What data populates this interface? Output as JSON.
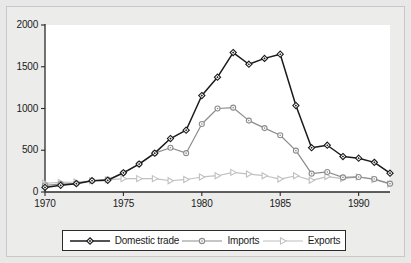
{
  "chart_data": {
    "type": "line",
    "title": "",
    "subtitle": "",
    "xlabel": "",
    "ylabel": "",
    "xlim": [
      1970,
      1992
    ],
    "ylim": [
      0,
      2000
    ],
    "grid": false,
    "legend_position": "bottom",
    "x": [
      1970,
      1971,
      1972,
      1973,
      1974,
      1975,
      1976,
      1977,
      1978,
      1979,
      1980,
      1981,
      1982,
      1983,
      1984,
      1985,
      1986,
      1987,
      1988,
      1989,
      1990,
      1991,
      1992
    ],
    "xticks": [
      1970,
      1975,
      1980,
      1985,
      1990
    ],
    "xticklabels": [
      "1970",
      "1975",
      "1980",
      "1985",
      "1990"
    ],
    "yticks": [
      0,
      500,
      1000,
      1500,
      2000
    ],
    "yticklabels": [
      "0",
      "500",
      "1000",
      "1500",
      "2000"
    ],
    "series": [
      {
        "name": "Domestic trade",
        "marker": "diamond",
        "color": "#1a1a1a",
        "values": [
          55,
          80,
          100,
          135,
          140,
          230,
          335,
          465,
          640,
          740,
          1155,
          1375,
          1670,
          1530,
          1600,
          1650,
          1035,
          530,
          560,
          425,
          405,
          355,
          225
        ]
      },
      {
        "name": "Imports",
        "marker": "circle",
        "color": "#8c8c8c",
        "values": [
          80,
          95,
          105,
          135,
          150,
          230,
          335,
          465,
          530,
          465,
          815,
          1000,
          1010,
          855,
          765,
          680,
          495,
          220,
          240,
          175,
          180,
          155,
          100
        ]
      },
      {
        "name": "Exports",
        "marker": "triangle-right",
        "color": "#c0c0c0",
        "values": [
          105,
          115,
          120,
          135,
          145,
          160,
          160,
          160,
          135,
          150,
          180,
          195,
          235,
          215,
          195,
          155,
          195,
          140,
          185,
          160,
          180,
          150,
          95
        ]
      }
    ]
  },
  "legend": {
    "items": [
      {
        "label": "Domestic trade",
        "marker": "diamond",
        "color": "#1a1a1a"
      },
      {
        "label": "Imports",
        "marker": "circle",
        "color": "#8c8c8c"
      },
      {
        "label": "Exports",
        "marker": "triangle-right",
        "color": "#c0c0c0"
      }
    ]
  },
  "colors": {
    "background": "#e8e8e8",
    "plot_background": "#ffffff",
    "axis": "#2b2b2b",
    "text": "#1a1a1a",
    "domestic_trade": "#1a1a1a",
    "imports": "#8c8c8c",
    "exports": "#c0c0c0"
  }
}
